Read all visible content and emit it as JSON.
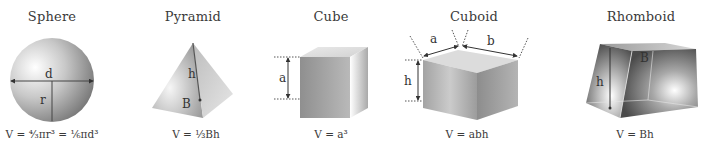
{
  "shapes": [
    {
      "id": "sphere",
      "title": "Sphere",
      "formula": "V = ⁴⁄₃πr³ = ⅙πd³",
      "labels": {
        "d": "d",
        "r": "r"
      }
    },
    {
      "id": "pyramid",
      "title": "Pyramid",
      "formula": "V = ⅓Bh",
      "labels": {
        "h": "h",
        "B": "B"
      }
    },
    {
      "id": "cube",
      "title": "Cube",
      "formula": "V = a³",
      "labels": {
        "a": "a"
      }
    },
    {
      "id": "cuboid",
      "title": "Cuboid",
      "formula": "V = abh",
      "labels": {
        "a": "a",
        "b": "b",
        "h": "h"
      }
    },
    {
      "id": "rhomboid",
      "title": "Rhomboid",
      "formula": "V = Bh",
      "labels": {
        "h": "h",
        "B": "B"
      }
    }
  ]
}
